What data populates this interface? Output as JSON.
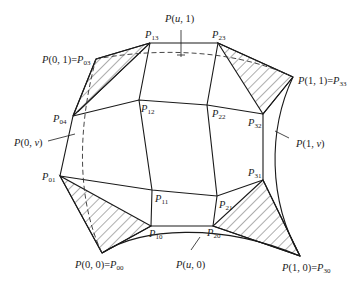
{
  "figure": {
    "labels": {
      "p_u1": "P(u, 1)",
      "p13": {
        "base": "P",
        "sub": "13"
      },
      "p23": {
        "base": "P",
        "sub": "23"
      },
      "p01_corner": {
        "prefix": "P(0, 1)=",
        "base": "P",
        "sub": "03"
      },
      "p11_corner": {
        "prefix": "P(1, 1)=",
        "base": "P",
        "sub": "33"
      },
      "p04": {
        "base": "P",
        "sub": "04"
      },
      "p12": {
        "base": "P",
        "sub": "12"
      },
      "p22": {
        "base": "P",
        "sub": "22"
      },
      "p32": {
        "base": "P",
        "sub": "32"
      },
      "p_0v": "P(0, v)",
      "p_1v": "P(1, v)",
      "p01": {
        "base": "P",
        "sub": "01"
      },
      "p11": {
        "base": "P",
        "sub": "11"
      },
      "p21": {
        "base": "P",
        "sub": "21"
      },
      "p31": {
        "base": "P",
        "sub": "31"
      },
      "p10": {
        "base": "P",
        "sub": "10"
      },
      "p20": {
        "base": "P",
        "sub": "20"
      },
      "p00_corner": {
        "prefix": "P(0, 0)=",
        "base": "P",
        "sub": "00"
      },
      "p_u0": "P(u, 0)",
      "p10_corner": {
        "prefix": "P(1, 0)=",
        "base": "P",
        "sub": "30"
      }
    },
    "control_points": {
      "P00": [
        102,
        253
      ],
      "P10": [
        151,
        226
      ],
      "P20": [
        213,
        226
      ],
      "P30": [
        300,
        256
      ],
      "P01": [
        60,
        176
      ],
      "P11": [
        152,
        190
      ],
      "P21": [
        217,
        196
      ],
      "P31": [
        263,
        180
      ],
      "P02": [
        73,
        116
      ],
      "P12": [
        139,
        100
      ],
      "P22": [
        207,
        105
      ],
      "P32": [
        263,
        114
      ],
      "P03": [
        96,
        59
      ],
      "P13": [
        150,
        43
      ],
      "P23": [
        218,
        43
      ],
      "P33": [
        293,
        77
      ]
    },
    "hatched_corners": [
      "P00",
      "P30",
      "P33",
      "P03"
    ]
  }
}
